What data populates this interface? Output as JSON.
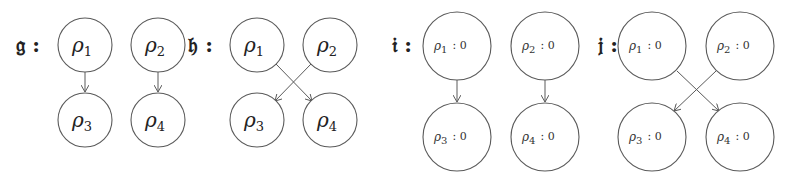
{
  "diagrams": [
    {
      "label": "𝔤 :",
      "nodes": [
        {
          "sym": "ρ",
          "sub": "1",
          "x": 85,
          "y": 45
        },
        {
          "sym": "ρ",
          "sub": "2",
          "x": 158,
          "y": 45
        },
        {
          "sym": "ρ",
          "sub": "3",
          "x": 85,
          "y": 120
        },
        {
          "sym": "ρ",
          "sub": "4",
          "x": 158,
          "y": 120
        }
      ],
      "edges": [
        [
          "ρ1",
          "ρ3"
        ],
        [
          "ρ2",
          "ρ4"
        ]
      ]
    },
    {
      "label": "𝔥 :",
      "nodes": [
        {
          "sym": "ρ",
          "sub": "1",
          "x": 257,
          "y": 45
        },
        {
          "sym": "ρ",
          "sub": "2",
          "x": 330,
          "y": 45
        },
        {
          "sym": "ρ",
          "sub": "3",
          "x": 257,
          "y": 120
        },
        {
          "sym": "ρ",
          "sub": "4",
          "x": 330,
          "y": 120
        }
      ],
      "edges": [
        [
          "ρ1",
          "ρ4"
        ],
        [
          "ρ2",
          "ρ3"
        ]
      ]
    },
    {
      "label": "𝔦 :",
      "nodes": [
        {
          "sym": "ρ",
          "sub": "1",
          "value": ": 0",
          "x": 457,
          "y": 46
        },
        {
          "sym": "ρ",
          "sub": "2",
          "value": ": 0",
          "x": 545,
          "y": 46
        },
        {
          "sym": "ρ",
          "sub": "3",
          "value": ": 0",
          "x": 457,
          "y": 137
        },
        {
          "sym": "ρ",
          "sub": "4",
          "value": ": 0",
          "x": 545,
          "y": 137
        }
      ],
      "edges": [
        [
          "ρ1",
          "ρ3"
        ],
        [
          "ρ2",
          "ρ4"
        ]
      ]
    },
    {
      "label": "𝔧 :",
      "nodes": [
        {
          "sym": "ρ",
          "sub": "1",
          "value": ": 0",
          "x": 652,
          "y": 46
        },
        {
          "sym": "ρ",
          "sub": "2",
          "value": ": 0",
          "x": 740,
          "y": 46
        },
        {
          "sym": "ρ",
          "sub": "3",
          "value": ": 0",
          "x": 652,
          "y": 137
        },
        {
          "sym": "ρ",
          "sub": "4",
          "value": ": 0",
          "x": 740,
          "y": 137
        }
      ],
      "edges": [
        [
          "ρ1",
          "ρ4"
        ],
        [
          "ρ2",
          "ρ3"
        ]
      ]
    }
  ]
}
